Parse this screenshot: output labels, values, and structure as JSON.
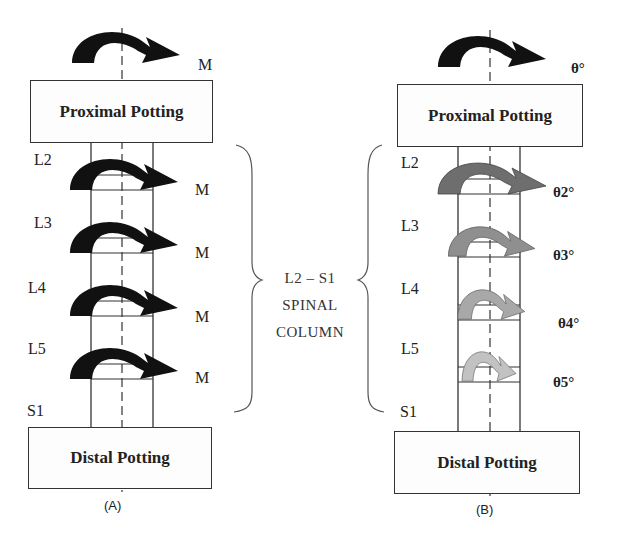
{
  "panels": {
    "A": {
      "label": "(A)",
      "proximal_box": "Proximal Potting",
      "distal_box": "Distal Potting",
      "top_load": "M",
      "vertebrae": [
        {
          "level": "L2",
          "load": "M"
        },
        {
          "level": "L3",
          "load": "M"
        },
        {
          "level": "L4",
          "load": "M"
        },
        {
          "level": "L5",
          "load": "M"
        },
        {
          "level": "S1"
        }
      ]
    },
    "B": {
      "label": "(B)",
      "proximal_box": "Proximal Potting",
      "distal_box": "Distal Potting",
      "top_load": "θ°",
      "vertebrae": [
        {
          "level": "L2",
          "load": "θ2°"
        },
        {
          "level": "L3",
          "load": "θ3°"
        },
        {
          "level": "L4",
          "load": "θ4°"
        },
        {
          "level": "L5",
          "load": "θ5°"
        },
        {
          "level": "S1"
        }
      ]
    }
  },
  "center": {
    "line1": "L2 – S1",
    "line2": "SPINAL",
    "line3": "COLUMN"
  },
  "colors": {
    "moment_arrow": "#111111",
    "rotation_arrow_L2": "#6e6e6e",
    "rotation_arrow_L3": "#8f8f8f",
    "rotation_arrow_L4": "#a8a8a8",
    "rotation_arrow_L5": "#c2c2c2",
    "outline": "#333333"
  }
}
